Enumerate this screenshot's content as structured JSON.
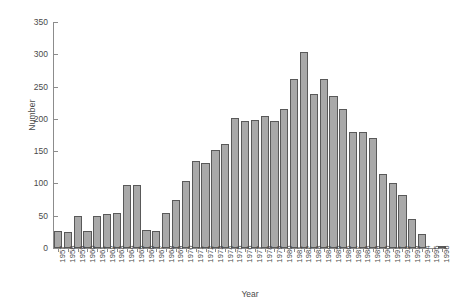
{
  "chart_data": {
    "type": "bar",
    "title": "",
    "xlabel": "Year",
    "ylabel": "Number",
    "categories": [
      "1957",
      "1958",
      "1959",
      "1960",
      "1961",
      "1962",
      "1963",
      "1964",
      "1965",
      "1966",
      "1967",
      "1968",
      "1969",
      "1970",
      "1971",
      "1972",
      "1973",
      "1974",
      "1975",
      "1976",
      "1977",
      "1978",
      "1979",
      "1980",
      "1981",
      "1982",
      "1983",
      "1984",
      "1985",
      "1986",
      "1987",
      "1988",
      "1989",
      "1990",
      "1991",
      "1992",
      "1993",
      "1994",
      "1995",
      "1996"
    ],
    "values": [
      27,
      25,
      49,
      27,
      49,
      53,
      55,
      98,
      97,
      28,
      27,
      54,
      75,
      104,
      135,
      132,
      152,
      161,
      201,
      196,
      199,
      204,
      197,
      216,
      262,
      303,
      239,
      261,
      236,
      216,
      179,
      180,
      170,
      115,
      100,
      82,
      45,
      21,
      0,
      3
    ],
    "ylim": [
      0,
      350
    ],
    "yticks": [
      "0",
      "50",
      "100",
      "150",
      "200",
      "250",
      "300",
      "350"
    ],
    "ytick_values": [
      0,
      50,
      100,
      150,
      200,
      250,
      300,
      350
    ],
    "grid": false,
    "legend": null,
    "bar_color": "#a9a9a9",
    "bar_edge_color": "#595959",
    "axis_color": "#8c8c8c",
    "text_color": "#4a4a4a"
  }
}
